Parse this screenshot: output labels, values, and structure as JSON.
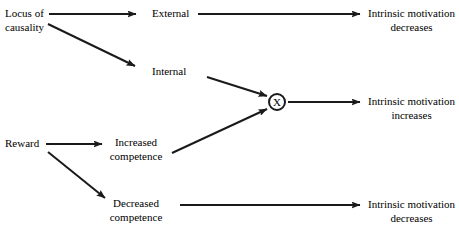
{
  "diagram": {
    "background_color": "#ffffff",
    "stroke_color": "#1a1a1a",
    "text_color": "#000000",
    "nodes": [
      {
        "id": "locus-of-causality",
        "name": "locus-of-causality",
        "lines": [
          "Locus of",
          "causality"
        ],
        "align": "left",
        "x": 5,
        "y": 7
      },
      {
        "id": "reward",
        "name": "reward",
        "lines": [
          "Reward"
        ],
        "align": "left",
        "x": 5,
        "y": 137
      },
      {
        "id": "external",
        "name": "external",
        "lines": [
          "External"
        ],
        "align": "left",
        "x": 152,
        "y": 7
      },
      {
        "id": "internal",
        "name": "internal",
        "lines": [
          "Internal"
        ],
        "align": "left",
        "x": 152,
        "y": 65
      },
      {
        "id": "increased-competence",
        "name": "increased-competence",
        "lines": [
          "Increased",
          "competence"
        ],
        "align": "center",
        "x": 136,
        "y": 136
      },
      {
        "id": "decreased-competence",
        "name": "decreased-competence",
        "lines": [
          "Decreased",
          "competence"
        ],
        "align": "center",
        "x": 136,
        "y": 197
      },
      {
        "id": "intrinsic-motivation-decreases-top",
        "name": "intrinsic-motivation-decreases-top",
        "lines": [
          "Intrinsic motivation",
          "decreases"
        ],
        "align": "left",
        "x": 368,
        "y": 7
      },
      {
        "id": "intrinsic-motivation-increases",
        "name": "intrinsic-motivation-increases",
        "lines": [
          "Intrinsic motivation",
          "increases"
        ],
        "align": "left",
        "x": 368,
        "y": 95
      },
      {
        "id": "intrinsic-motivation-decreases-bottom",
        "name": "intrinsic-motivation-decreases-bottom",
        "lines": [
          "Intrinsic motivation",
          "decreases"
        ],
        "align": "left",
        "x": 368,
        "y": 198
      }
    ],
    "interaction_node": {
      "id": "interaction-operator",
      "name": "interaction-multiplier-node",
      "symbol": "X",
      "cx": 277,
      "cy": 102,
      "r": 8
    },
    "edges": [
      {
        "id": "locus-to-external",
        "from": "locus-of-causality",
        "to": "external",
        "x1": 49,
        "y1": 14,
        "x2": 136,
        "y2": 14
      },
      {
        "id": "locus-to-internal",
        "from": "locus-of-causality",
        "to": "internal",
        "x1": 48,
        "y1": 24,
        "x2": 135,
        "y2": 66
      },
      {
        "id": "external-to-decreases",
        "from": "external",
        "to": "intrinsic-motivation-decreases-top",
        "x1": 198,
        "y1": 14,
        "x2": 360,
        "y2": 14
      },
      {
        "id": "internal-to-interaction",
        "from": "internal",
        "to": "interaction-operator",
        "x1": 207,
        "y1": 77,
        "x2": 267,
        "y2": 96
      },
      {
        "id": "reward-to-increased",
        "from": "reward",
        "to": "increased-competence",
        "x1": 46,
        "y1": 144,
        "x2": 102,
        "y2": 144
      },
      {
        "id": "reward-to-decreased",
        "from": "reward",
        "to": "decreased-competence",
        "x1": 48,
        "y1": 152,
        "x2": 105,
        "y2": 198
      },
      {
        "id": "increased-to-interaction",
        "from": "increased-competence",
        "to": "interaction-operator",
        "x1": 172,
        "y1": 153,
        "x2": 267,
        "y2": 109
      },
      {
        "id": "interaction-to-increases",
        "from": "interaction-operator",
        "to": "intrinsic-motivation-increases",
        "x1": 288,
        "y1": 102,
        "x2": 360,
        "y2": 102
      },
      {
        "id": "decreased-to-decreases",
        "from": "decreased-competence",
        "to": "intrinsic-motivation-decreases-bottom",
        "x1": 180,
        "y1": 205,
        "x2": 360,
        "y2": 205
      }
    ]
  }
}
